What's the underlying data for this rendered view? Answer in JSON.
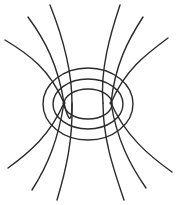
{
  "diagram": {
    "type": "field-line-diagram",
    "colors": {
      "stroke": "#2a2a2a",
      "background": "#ffffff"
    },
    "charges": [
      {
        "id": "left-charge",
        "x": 64,
        "y": 103,
        "r": 1.6
      },
      {
        "id": "right-charge",
        "x": 111,
        "y": 103,
        "r": 1.6
      }
    ],
    "equipotentials": [
      {
        "id": "outer",
        "cx": 88,
        "cy": 104,
        "rx": 45,
        "ry": 36
      },
      {
        "id": "middle",
        "cx": 88,
        "cy": 104,
        "rx": 35,
        "ry": 25
      },
      {
        "id": "inner",
        "cx": 88,
        "cy": 104,
        "rx": 24,
        "ry": 15
      }
    ],
    "field_lines": [
      {
        "id": "top-left-1",
        "d": "M5,40 C30,55 50,70 64,103"
      },
      {
        "id": "top-left-2",
        "d": "M28,17 C45,40 58,65 64,103"
      },
      {
        "id": "top-left-3",
        "d": "M50,5 C62,35 72,70 72,103 C72,118 70,128 64,103"
      },
      {
        "id": "top-right-1",
        "d": "M168,38 C145,55 125,70 111,103"
      },
      {
        "id": "top-right-2",
        "d": "M143,17 C128,40 115,65 111,103"
      },
      {
        "id": "top-right-3",
        "d": "M120,5 C110,35 100,70 103,103"
      },
      {
        "id": "bottom-left-1",
        "d": "M8,168 C30,152 50,135 64,103"
      },
      {
        "id": "bottom-left-2",
        "d": "M32,190 C48,165 58,140 64,103"
      },
      {
        "id": "bottom-left-3",
        "d": "M57,200 C66,170 73,140 72,103"
      },
      {
        "id": "bottom-right-1",
        "d": "M172,172 C148,155 125,135 111,103"
      },
      {
        "id": "bottom-right-2",
        "d": "M146,188 C130,165 117,140 111,103"
      },
      {
        "id": "bottom-right-3",
        "d": "M124,200 C114,170 103,140 103,103"
      }
    ]
  }
}
